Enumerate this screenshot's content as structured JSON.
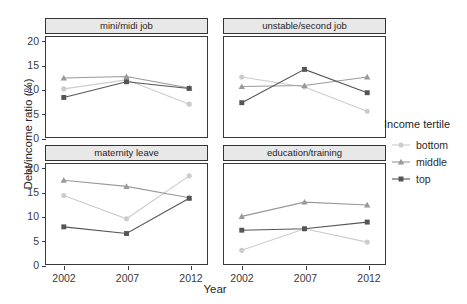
{
  "chart_data": {
    "type": "line",
    "title": "",
    "xlabel": "Year",
    "ylabel": "Debt/income ratio (%)",
    "x": [
      2002,
      2007,
      2012
    ],
    "xtick_labels": [
      "2002",
      "2007",
      "2012"
    ],
    "ytick_labels": [
      "0",
      "5",
      "10",
      "15",
      "20"
    ],
    "ytick_values": [
      0,
      5,
      10,
      15,
      20
    ],
    "ylim": [
      0,
      21
    ],
    "grid": false,
    "legend": {
      "title": "Income tertile",
      "position": "right",
      "entries": [
        {
          "name": "bottom",
          "marker": "circle",
          "color": "#cccccc"
        },
        {
          "name": "middle",
          "marker": "triangle",
          "color": "#999999"
        },
        {
          "name": "top",
          "marker": "square",
          "color": "#555555"
        }
      ]
    },
    "facets": [
      {
        "label": "mini/midi job",
        "row": 0,
        "col": 0,
        "series": [
          {
            "name": "bottom",
            "marker": "circle",
            "color": "#cccccc",
            "values": [
              10.1,
              12.0,
              6.9
            ]
          },
          {
            "name": "middle",
            "marker": "triangle",
            "color": "#999999",
            "values": [
              12.4,
              12.7,
              10.3
            ]
          },
          {
            "name": "top",
            "marker": "square",
            "color": "#555555",
            "values": [
              8.3,
              11.6,
              10.2
            ]
          }
        ]
      },
      {
        "label": "unstable/second job",
        "row": 0,
        "col": 1,
        "series": [
          {
            "name": "bottom",
            "marker": "circle",
            "color": "#cccccc",
            "values": [
              12.6,
              10.5,
              5.4
            ]
          },
          {
            "name": "middle",
            "marker": "triangle",
            "color": "#999999",
            "values": [
              10.6,
              10.8,
              12.6
            ]
          },
          {
            "name": "top",
            "marker": "square",
            "color": "#555555",
            "values": [
              7.2,
              14.2,
              9.3
            ]
          }
        ]
      },
      {
        "label": "maternity leave",
        "row": 1,
        "col": 0,
        "series": [
          {
            "name": "bottom",
            "marker": "circle",
            "color": "#cccccc",
            "values": [
              14.4,
              9.5,
              18.5
            ]
          },
          {
            "name": "middle",
            "marker": "triangle",
            "color": "#999999",
            "values": [
              17.6,
              16.3,
              13.9
            ]
          },
          {
            "name": "top",
            "marker": "square",
            "color": "#555555",
            "values": [
              7.8,
              6.4,
              13.8
            ]
          }
        ]
      },
      {
        "label": "education/training",
        "row": 1,
        "col": 1,
        "series": [
          {
            "name": "bottom",
            "marker": "circle",
            "color": "#cccccc",
            "values": [
              2.9,
              7.4,
              4.6
            ]
          },
          {
            "name": "middle",
            "marker": "triangle",
            "color": "#999999",
            "values": [
              10.0,
              13.0,
              12.4
            ]
          },
          {
            "name": "top",
            "marker": "square",
            "color": "#555555",
            "values": [
              7.1,
              7.4,
              8.8
            ]
          }
        ]
      }
    ]
  }
}
